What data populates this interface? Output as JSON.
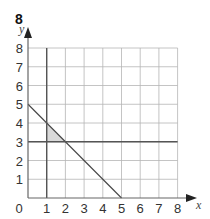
{
  "question_number": "8",
  "chart_data": {
    "type": "line",
    "title": "",
    "xlabel": "x",
    "ylabel": "y",
    "xlim": [
      0,
      8
    ],
    "ylim": [
      0,
      8
    ],
    "grid": true,
    "x_ticks": [
      "0",
      "1",
      "2",
      "3",
      "4",
      "5",
      "6",
      "7",
      "8"
    ],
    "y_ticks": [
      "1",
      "2",
      "3",
      "4",
      "5",
      "6",
      "7",
      "8"
    ],
    "lines": [
      {
        "name": "x + y = 5",
        "points": [
          [
            0,
            5
          ],
          [
            5,
            0
          ]
        ],
        "color": "#444444"
      },
      {
        "name": "y = 3",
        "points": [
          [
            0,
            3
          ],
          [
            8,
            3
          ]
        ],
        "color": "#555555"
      },
      {
        "name": "x = 1",
        "points": [
          [
            1,
            0
          ],
          [
            1,
            8
          ]
        ],
        "color": "#555555"
      }
    ],
    "shaded_region": {
      "vertices": [
        [
          1,
          3
        ],
        [
          1,
          4
        ],
        [
          2,
          3
        ]
      ],
      "color": "#d9d9d9"
    }
  }
}
